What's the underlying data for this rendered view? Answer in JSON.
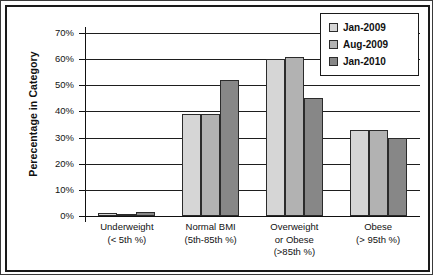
{
  "chart_data": {
    "type": "bar",
    "title": "",
    "subtitle": "",
    "xlabel": "",
    "ylabel": "Perecentage in Category",
    "ylim": [
      0,
      70
    ],
    "ytick_labels": [
      "70%",
      "60%",
      "50%",
      "40%",
      "30%",
      "20%",
      "10%",
      "0%"
    ],
    "ytick_values": [
      70,
      60,
      50,
      40,
      30,
      20,
      10,
      0
    ],
    "grid": true,
    "legend_position": "top-right",
    "categories": [
      "Underweight\n(< 5th %)",
      "Normal BMI\n(5th-85th %)",
      "Overweight\nor Obese\n(>85th %)",
      "Obese\n(> 95th %)"
    ],
    "category_lines": [
      [
        "Underweight",
        "(< 5th %)"
      ],
      [
        "Normal BMI",
        "(5th-85th %)"
      ],
      [
        "Overweight",
        "or Obese",
        "(>85th %)"
      ],
      [
        "Obese",
        "(> 95th %)"
      ]
    ],
    "series": [
      {
        "name": "Jan-2009",
        "color": "#d6d6d6",
        "values": [
          1,
          39,
          60,
          33
        ]
      },
      {
        "name": "Aug-2009",
        "color": "#b2b2b2",
        "values": [
          0.5,
          39,
          61,
          33
        ]
      },
      {
        "name": "Jan-2010",
        "color": "#878787",
        "values": [
          1.5,
          52,
          45,
          30
        ]
      }
    ]
  },
  "legend": {
    "items": [
      {
        "label": "Jan-2009",
        "swatch": "light-gray-swatch"
      },
      {
        "label": "Aug-2009",
        "swatch": "medium-gray-swatch"
      },
      {
        "label": "Jan-2010",
        "swatch": "dark-gray-swatch"
      }
    ]
  },
  "axes": {
    "y_title": "Perecentage in Category",
    "y_ticks": [
      "70%",
      "60%",
      "50%",
      "40%",
      "30%",
      "20%",
      "10%",
      "0%"
    ]
  },
  "colors": {
    "series_1": "#d6d6d6",
    "series_2": "#b2b2b2",
    "series_3": "#878787",
    "frame": "#1a1a1a",
    "gridline": "#1e1e1e",
    "text": "#111111",
    "background": "#ffffff"
  }
}
